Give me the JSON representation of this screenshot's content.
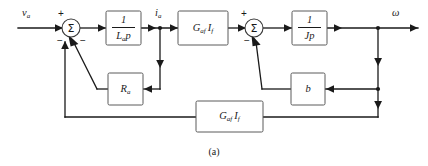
{
  "figure": {
    "caption": "(a)",
    "signals": {
      "input": {
        "base": "v",
        "sub": "a",
        "name": "armature-voltage"
      },
      "current": {
        "base": "i",
        "sub": "a",
        "name": "armature-current"
      },
      "output": {
        "base": "ω",
        "sub": "",
        "name": "angular-velocity"
      }
    },
    "summing_junctions": [
      {
        "id": "sum-1",
        "glyph": "Σ",
        "signs": {
          "input": "+",
          "feedback_left": "−",
          "feedback_right": "−"
        }
      },
      {
        "id": "sum-2",
        "glyph": "Σ",
        "signs": {
          "input": "+",
          "feedback_left": "−"
        }
      }
    ],
    "blocks": [
      {
        "id": "block-inductance",
        "kind": "fraction",
        "numerator": "1",
        "denominator_base": "L",
        "denominator_sub": "a",
        "denominator_tail": "p",
        "label": "1 / L_a p"
      },
      {
        "id": "block-torque-constant",
        "kind": "product",
        "term1_base": "G",
        "term1_sub": "af",
        "term2_base": "I",
        "term2_sub": "f",
        "label": "G_af I_f"
      },
      {
        "id": "block-inertia",
        "kind": "fraction",
        "numerator": "1",
        "denominator_base": "J",
        "denominator_sub": "",
        "denominator_tail": "p",
        "label": "1 / Jp"
      },
      {
        "id": "block-armature-resistance",
        "kind": "simple",
        "term1_base": "R",
        "term1_sub": "a",
        "label": "R_a"
      },
      {
        "id": "block-damping",
        "kind": "simple",
        "term1_base": "b",
        "term1_sub": "",
        "label": "b"
      },
      {
        "id": "block-back-emf",
        "kind": "product",
        "term1_base": "G",
        "term1_sub": "af",
        "term2_base": "I",
        "term2_sub": "f",
        "label": "G_af I_f"
      }
    ],
    "colors": {
      "wire": "#1a1a1a",
      "block_border": "#5a5a5a",
      "background": "#ffffff"
    }
  }
}
